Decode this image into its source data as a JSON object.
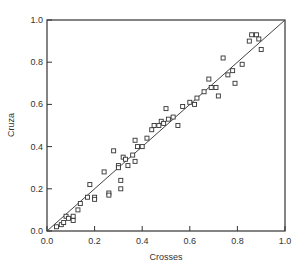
{
  "chart_data": {
    "type": "scatter",
    "title": "",
    "xlabel": "Crosses",
    "ylabel": "Cruza",
    "xlim": [
      0.0,
      1.0
    ],
    "ylim": [
      0.0,
      1.0
    ],
    "grid": false,
    "legend": null,
    "xticks": [
      "0.0",
      "0.2",
      "0.4",
      "0.6",
      "0.8",
      "1.0"
    ],
    "yticks": [
      "0.0",
      "0.2",
      "0.4",
      "0.6",
      "0.8",
      "1.0"
    ],
    "reference_line": {
      "from": [
        0.0,
        0.0
      ],
      "to": [
        1.0,
        1.0
      ],
      "label": "y = x"
    },
    "series": [
      {
        "name": "points",
        "marker": "open-square",
        "points": [
          [
            0.04,
            0.02
          ],
          [
            0.06,
            0.03
          ],
          [
            0.07,
            0.04
          ],
          [
            0.08,
            0.07
          ],
          [
            0.09,
            0.06
          ],
          [
            0.11,
            0.05
          ],
          [
            0.11,
            0.07
          ],
          [
            0.13,
            0.1
          ],
          [
            0.14,
            0.13
          ],
          [
            0.17,
            0.16
          ],
          [
            0.18,
            0.22
          ],
          [
            0.2,
            0.16
          ],
          [
            0.2,
            0.15
          ],
          [
            0.24,
            0.28
          ],
          [
            0.26,
            0.18
          ],
          [
            0.26,
            0.17
          ],
          [
            0.28,
            0.38
          ],
          [
            0.3,
            0.31
          ],
          [
            0.3,
            0.3
          ],
          [
            0.31,
            0.24
          ],
          [
            0.31,
            0.2
          ],
          [
            0.32,
            0.35
          ],
          [
            0.33,
            0.34
          ],
          [
            0.34,
            0.31
          ],
          [
            0.36,
            0.36
          ],
          [
            0.37,
            0.33
          ],
          [
            0.37,
            0.43
          ],
          [
            0.38,
            0.4
          ],
          [
            0.4,
            0.4
          ],
          [
            0.42,
            0.44
          ],
          [
            0.44,
            0.48
          ],
          [
            0.45,
            0.5
          ],
          [
            0.47,
            0.5
          ],
          [
            0.48,
            0.52
          ],
          [
            0.49,
            0.51
          ],
          [
            0.5,
            0.58
          ],
          [
            0.51,
            0.53
          ],
          [
            0.53,
            0.54
          ],
          [
            0.55,
            0.5
          ],
          [
            0.57,
            0.59
          ],
          [
            0.6,
            0.61
          ],
          [
            0.62,
            0.6
          ],
          [
            0.63,
            0.63
          ],
          [
            0.66,
            0.66
          ],
          [
            0.68,
            0.72
          ],
          [
            0.69,
            0.68
          ],
          [
            0.71,
            0.68
          ],
          [
            0.72,
            0.64
          ],
          [
            0.74,
            0.82
          ],
          [
            0.76,
            0.74
          ],
          [
            0.78,
            0.76
          ],
          [
            0.79,
            0.7
          ],
          [
            0.82,
            0.79
          ],
          [
            0.86,
            0.93
          ],
          [
            0.88,
            0.93
          ],
          [
            0.89,
            0.91
          ],
          [
            0.9,
            0.86
          ],
          [
            0.85,
            0.9
          ]
        ]
      }
    ]
  }
}
